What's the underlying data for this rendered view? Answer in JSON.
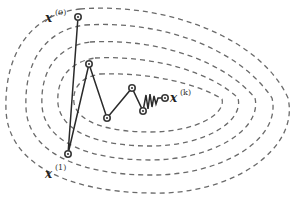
{
  "diagram": {
    "type": "optimization-trajectory-on-contours",
    "contour_count": 5,
    "colors": {
      "contour": "#6a6a6a",
      "trajectory": "#2a2a2a",
      "background": "#ffffff"
    },
    "labels": {
      "start": {
        "base": "x",
        "superscript": "(0)"
      },
      "first": {
        "base": "x",
        "superscript": "(1)"
      },
      "final": {
        "base": "x",
        "superscript": "(k)"
      }
    },
    "iterates": [
      {
        "id": "x0",
        "x": 78,
        "y": 17
      },
      {
        "id": "x1",
        "x": 68,
        "y": 154
      },
      {
        "id": "x2",
        "x": 89,
        "y": 64
      },
      {
        "id": "x3",
        "x": 107,
        "y": 118
      },
      {
        "id": "x4",
        "x": 132,
        "y": 88
      },
      {
        "id": "x5",
        "x": 143,
        "y": 111
      },
      {
        "id": "xk",
        "x": 165,
        "y": 98
      }
    ]
  }
}
